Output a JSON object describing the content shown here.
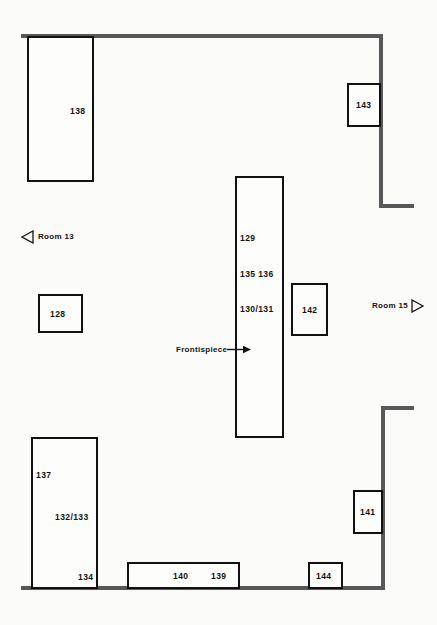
{
  "plan": {
    "title": "Gallery floor plan",
    "background_color": "#fbfbfa",
    "wall_color": "#58585a",
    "case_outline_color": "#111111",
    "text_color": "#141414"
  },
  "cases": [
    {
      "id": "case-138",
      "label": "138"
    },
    {
      "id": "case-143",
      "label": "143"
    },
    {
      "id": "case-128",
      "label": "128"
    },
    {
      "id": "case-142",
      "label": "142"
    },
    {
      "id": "case-141",
      "label": "141"
    },
    {
      "id": "case-144",
      "label": "144"
    }
  ],
  "center_case": {
    "id": "case-center",
    "labels": [
      {
        "id": "label-129",
        "text": "129"
      },
      {
        "id": "label-135-136",
        "text": "135  136"
      },
      {
        "id": "label-130-131",
        "text": "130/131"
      }
    ]
  },
  "lower_left_case": {
    "id": "case-lower-left",
    "labels": [
      {
        "id": "label-137",
        "text": "137"
      },
      {
        "id": "label-132-133",
        "text": "132/133"
      },
      {
        "id": "label-134",
        "text": "134"
      }
    ]
  },
  "lower_center_case": {
    "id": "case-lower-center",
    "labels": [
      {
        "id": "label-140",
        "text": "140"
      },
      {
        "id": "label-139",
        "text": "139"
      }
    ]
  },
  "annotations": {
    "frontispiece": {
      "text": "Frontispiece",
      "icon": "arrow-right-icon"
    },
    "room_13": {
      "text": "Room 13",
      "icon": "triangle-left-icon"
    },
    "room_15": {
      "text": "Room 15",
      "icon": "triangle-right-icon"
    }
  }
}
